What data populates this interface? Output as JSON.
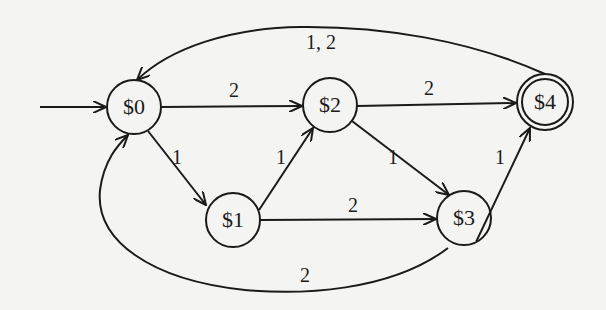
{
  "diagram": {
    "type": "finite-state-automaton",
    "colors": {
      "background": "#f4f4f2",
      "stroke": "#1a1a1a"
    },
    "start_state": "$0",
    "accepting_states": [
      "$4"
    ],
    "nodes": [
      {
        "id": "s0",
        "label": "$0",
        "x": 134,
        "y": 107,
        "accepting": false
      },
      {
        "id": "s1",
        "label": "$1",
        "x": 233,
        "y": 220,
        "accepting": false
      },
      {
        "id": "s2",
        "label": "$2",
        "x": 330,
        "y": 105,
        "accepting": false
      },
      {
        "id": "s3",
        "label": "$3",
        "x": 464,
        "y": 218,
        "accepting": false
      },
      {
        "id": "s4",
        "label": "$4",
        "x": 545,
        "y": 102,
        "accepting": true
      }
    ],
    "edges": [
      {
        "from": "$0",
        "to": "$2",
        "label": "2"
      },
      {
        "from": "$0",
        "to": "$1",
        "label": "1"
      },
      {
        "from": "$1",
        "to": "$2",
        "label": "1"
      },
      {
        "from": "$1",
        "to": "$3",
        "label": "2"
      },
      {
        "from": "$2",
        "to": "$4",
        "label": "2"
      },
      {
        "from": "$2",
        "to": "$3",
        "label": "1"
      },
      {
        "from": "$3",
        "to": "$4",
        "label": "1"
      },
      {
        "from": "$3",
        "to": "$0",
        "label": "2"
      },
      {
        "from": "$4",
        "to": "$0",
        "label": "1, 2"
      }
    ]
  }
}
